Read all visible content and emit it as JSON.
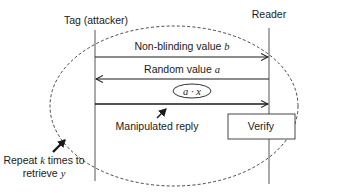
{
  "diagram": {
    "type": "sequence",
    "participants": [
      {
        "id": "tag",
        "label": "Tag (attacker)"
      },
      {
        "id": "reader",
        "label": "Reader"
      }
    ],
    "messages": [
      {
        "from": "tag",
        "to": "reader",
        "label_text": "Non-blinding value ",
        "label_var": "b"
      },
      {
        "from": "reader",
        "to": "tag",
        "label_text": "Random value ",
        "label_var": "a"
      },
      {
        "from": "tag",
        "to": "reader",
        "payload": "a · x",
        "annotation": "Manipulated reply"
      }
    ],
    "process_box": {
      "label": "Verify",
      "participant": "reader"
    },
    "loop": {
      "style": "dashed ellipse",
      "note_line1_pre": "Repeat ",
      "note_line1_var": "k",
      "note_line1_post": " times to",
      "note_line2_pre": "retrieve ",
      "note_line2_var": "y"
    },
    "colors": {
      "line": "#1a1a1a",
      "lifeline": "#555555",
      "background": "#ffffff"
    }
  }
}
